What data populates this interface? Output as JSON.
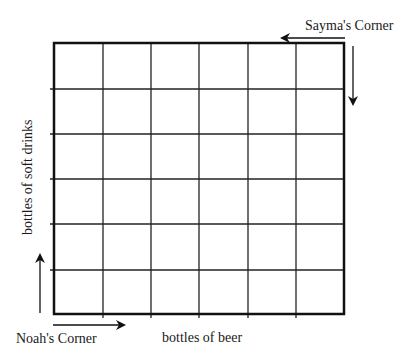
{
  "diagram": {
    "grid": {
      "columns": 6,
      "rows": 6
    },
    "labels": {
      "top_right_corner": "Sayma's Corner",
      "bottom_left_corner": "Noah's Corner",
      "x_axis": "bottles of beer",
      "y_axis": "bottles of soft drinks"
    },
    "arrows": [
      {
        "name": "sayma-left-arrow",
        "direction": "left"
      },
      {
        "name": "sayma-down-arrow",
        "direction": "down"
      },
      {
        "name": "noah-up-arrow",
        "direction": "up"
      },
      {
        "name": "noah-right-arrow",
        "direction": "right"
      }
    ],
    "colors": {
      "line": "#111111",
      "background": "#ffffff"
    }
  }
}
